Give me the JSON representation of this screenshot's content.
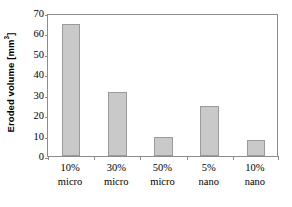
{
  "chart_data": {
    "type": "bar",
    "title": "",
    "xlabel": "",
    "ylabel": "Eroded volume [mm³]",
    "ylabel_base": "Eroded volume [mm",
    "ylabel_sup": "3",
    "ylabel_tail": "]",
    "categories": [
      "10% micro",
      "30% micro",
      "50% micro",
      "5% nano",
      "10% nano"
    ],
    "category_lines": [
      [
        "10%",
        "micro"
      ],
      [
        "30%",
        "micro"
      ],
      [
        "50%",
        "micro"
      ],
      [
        "5%",
        "nano"
      ],
      [
        "10%",
        "nano"
      ]
    ],
    "values": [
      64.5,
      31.2,
      9.5,
      24.5,
      7.6
    ],
    "ylim": [
      0,
      70
    ],
    "ytick_values": [
      0,
      10,
      20,
      30,
      40,
      50,
      60,
      70
    ],
    "ytick_labels": [
      "0",
      "10",
      "20",
      "30",
      "40",
      "50",
      "60",
      "70"
    ],
    "grid": false,
    "legend": "none",
    "bar_fill_color": "#c9c9c9",
    "bar_edge_color": "#9a9a9a",
    "axis_color": "#8c8c8c",
    "text_color": "#000000",
    "background_color": "#ffffff"
  }
}
